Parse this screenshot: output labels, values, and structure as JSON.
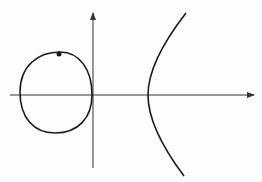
{
  "figure": {
    "type": "elliptic-curve-plot",
    "width": 262,
    "height": 182,
    "background": "#fdfdfd",
    "stroke_color": "#1a1a1a",
    "axis_color": "#333333",
    "axes": {
      "x_axis": {
        "y": 95,
        "x_start": 10,
        "x_end": 254,
        "arrow": "right"
      },
      "y_axis": {
        "x": 93,
        "y_start": 168,
        "y_end": 13,
        "arrow": "up"
      }
    },
    "oval_component": {
      "path": "M 92 95 C 92 70, 80 52, 60 52 C 38 52, 20 66, 20 92 C 20 118, 34 133, 55 133 C 78 133, 92 118, 92 95 Z"
    },
    "unbounded_component": {
      "path": "M 186 13 C 165 40, 148 70, 148 95 C 148 120, 163 148, 184 176"
    },
    "marked_point": {
      "cx": 59,
      "cy": 54,
      "r": 2.5
    }
  }
}
